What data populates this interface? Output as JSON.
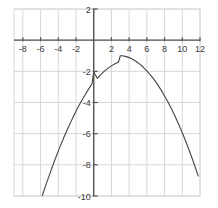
{
  "chart_data": {
    "type": "line",
    "title": "",
    "subtitle": "",
    "xlabel": "",
    "ylabel": "",
    "grid": true,
    "legend": false,
    "legend_position": "none",
    "xlim": [
      -9,
      12
    ],
    "ylim": [
      -10,
      2
    ],
    "xticks": [
      -8,
      -6,
      -4,
      -2,
      2,
      4,
      6,
      8,
      10,
      12
    ],
    "yticks": [
      2,
      -2,
      -4,
      -6,
      -8,
      -10
    ],
    "xtick_labels": [
      "-8",
      "-6",
      "-4",
      "-2",
      "2",
      "4",
      "6",
      "8",
      "10",
      "12"
    ],
    "ytick_labels": [
      "2",
      "-2",
      "-4",
      "-6",
      "-8",
      "-10"
    ],
    "x_tick_step": 2,
    "y_tick_step": 2,
    "grid_x_step": 2,
    "grid_y_step": 2,
    "axis_color": "#555555",
    "grid_color": "#d8d8d8",
    "curve_color": "#444444",
    "background_color": "#ffffff",
    "series": [
      {
        "name": "parabola",
        "equation": "y = -0.115(x - 3)^2 - 1",
        "vertex": [
          3,
          -1
        ],
        "y_intercept": -2,
        "x_domain": [
          -5.8,
          11.8
        ],
        "x": [
          -5.8,
          -5.4,
          -5.0,
          -4.6,
          -4.2,
          -3.8,
          -3.4,
          -3.0,
          -2.6,
          -2.2,
          -1.8,
          -1.4,
          -1.0,
          -0.6,
          -0.2,
          0.0,
          0.4,
          0.8,
          1.2,
          1.6,
          2.0,
          2.4,
          2.8,
          3.0,
          3.2,
          3.6,
          4.0,
          4.4,
          4.8,
          5.2,
          5.6,
          6.0,
          6.4,
          6.8,
          7.2,
          7.6,
          8.0,
          8.4,
          8.8,
          9.2,
          9.6,
          10.0,
          10.4,
          10.8,
          11.2,
          11.6,
          11.8
        ],
        "y": [
          -9.97,
          -9.29,
          -8.64,
          -8.01,
          -7.41,
          -6.83,
          -6.28,
          -5.76,
          -5.26,
          -4.79,
          -4.34,
          -3.92,
          -3.53,
          -3.16,
          -2.81,
          -2.04,
          -2.45,
          -2.21,
          -1.99,
          -1.81,
          -1.65,
          -1.51,
          -1.4,
          -1.0,
          -1.0,
          -1.04,
          -1.12,
          -1.23,
          -1.37,
          -1.54,
          -1.74,
          -1.97,
          -2.23,
          -2.52,
          -2.84,
          -3.19,
          -3.58,
          -3.99,
          -4.43,
          -4.9,
          -5.41,
          -5.94,
          -6.5,
          -7.1,
          -7.72,
          -8.38,
          -8.72
        ]
      }
    ]
  }
}
